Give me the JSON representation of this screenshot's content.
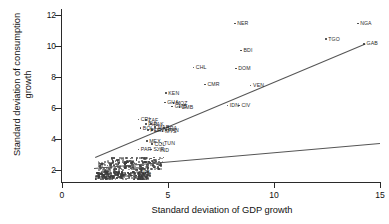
{
  "chart_data": {
    "type": "scatter",
    "title": "",
    "xlabel": "Standard deviation of GDP growth",
    "ylabel": "Standard deviation of consumption growth",
    "xlim": [
      0,
      15
    ],
    "ylim": [
      1.2,
      12.4
    ],
    "xticks": [
      0,
      5,
      10,
      15
    ],
    "yticks": [
      2,
      4,
      6,
      8,
      10,
      12
    ],
    "grid": false,
    "legend": "none",
    "marker": "small-dot-with-country-code-label",
    "labeled_points": [
      {
        "code": "NER",
        "x": 8.15,
        "y": 11.45
      },
      {
        "code": "NGA",
        "x": 13.95,
        "y": 11.45
      },
      {
        "code": "TGO",
        "x": 12.45,
        "y": 10.45
      },
      {
        "code": "GAB",
        "x": 14.25,
        "y": 10.15
      },
      {
        "code": "BDI",
        "x": 8.45,
        "y": 9.7
      },
      {
        "code": "CHL",
        "x": 6.2,
        "y": 8.6
      },
      {
        "code": "DOM",
        "x": 8.2,
        "y": 8.55
      },
      {
        "code": "CMR",
        "x": 6.75,
        "y": 7.5
      },
      {
        "code": "VEN",
        "x": 8.9,
        "y": 7.45
      },
      {
        "code": "KEN",
        "x": 4.9,
        "y": 6.95
      },
      {
        "code": "GHA",
        "x": 4.85,
        "y": 6.35
      },
      {
        "code": "MOZ",
        "x": 5.25,
        "y": 6.3
      },
      {
        "code": "GMB",
        "x": 5.2,
        "y": 6.1
      },
      {
        "code": "ZMB",
        "x": 5.55,
        "y": 6.05
      },
      {
        "code": "IDN",
        "x": 7.8,
        "y": 6.15
      },
      {
        "code": "CIV",
        "x": 8.35,
        "y": 6.15
      },
      {
        "code": "CRI",
        "x": 3.6,
        "y": 5.25
      },
      {
        "code": "ZAF",
        "x": 3.95,
        "y": 5.2
      },
      {
        "code": "PHL",
        "x": 3.95,
        "y": 4.95
      },
      {
        "code": "PAK",
        "x": 4.2,
        "y": 4.95
      },
      {
        "code": "BOL",
        "x": 3.7,
        "y": 4.7
      },
      {
        "code": "MAR",
        "x": 4.4,
        "y": 4.75
      },
      {
        "code": "BRA",
        "x": 4.8,
        "y": 4.7
      },
      {
        "code": "URY",
        "x": 4.25,
        "y": 4.55
      },
      {
        "code": "PER",
        "x": 4.05,
        "y": 4.55
      },
      {
        "code": "MYS",
        "x": 4.75,
        "y": 4.5
      },
      {
        "code": "PAN",
        "x": 4.9,
        "y": 4.55
      },
      {
        "code": "MEX",
        "x": 4.0,
        "y": 3.85
      },
      {
        "code": "COL",
        "x": 4.25,
        "y": 3.65
      },
      {
        "code": "TUN",
        "x": 4.7,
        "y": 3.7
      },
      {
        "code": "PAR",
        "x": 3.6,
        "y": 3.3
      },
      {
        "code": "SYR",
        "x": 4.2,
        "y": 3.3
      },
      {
        "code": "IND",
        "x": 4.5,
        "y": 3.25
      },
      {
        "code": "NPL",
        "x": 3.6,
        "y": 1.8
      }
    ],
    "fit_lines": [
      {
        "name": "steep-fit",
        "x0": 1.55,
        "y0": 2.85,
        "x1": 14.3,
        "y1": 10.2
      },
      {
        "name": "shallow-fit",
        "x0": 1.5,
        "y0": 2.1,
        "x1": 15.0,
        "y1": 3.72
      }
    ],
    "dense_cluster_note": "large overlapping mass of unlabeled country points between x=1.5-4.8 and y=1.4-2.7"
  },
  "axes": {
    "ylabel_line1": "Standard deviation of consumption",
    "ylabel_line2": "growth",
    "xlabel": "Standard deviation of GDP growth",
    "yticks": [
      "12",
      "10",
      "8",
      "6",
      "4",
      "2"
    ],
    "xticks": [
      "0",
      "5",
      "10",
      "15"
    ]
  }
}
